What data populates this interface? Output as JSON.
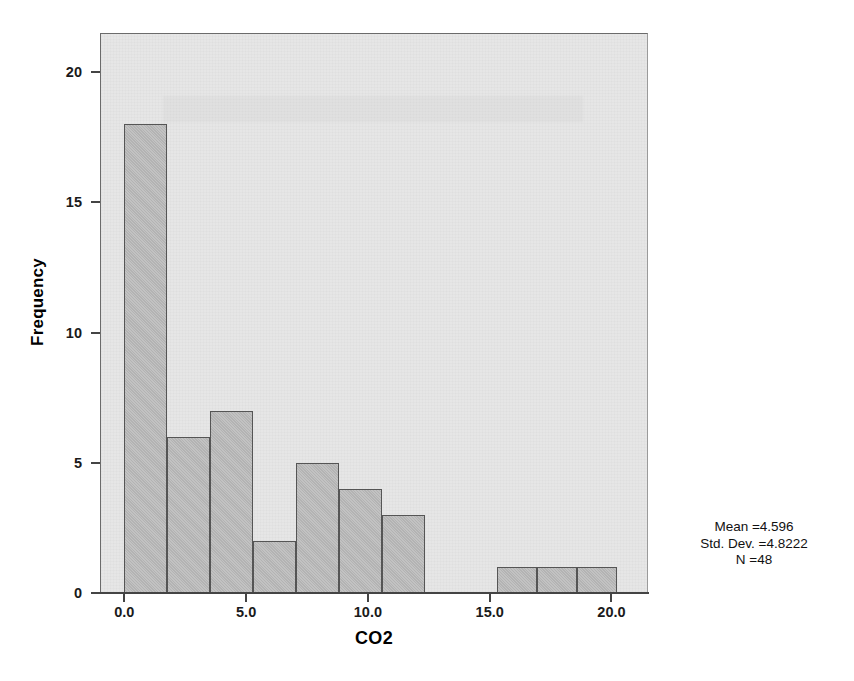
{
  "chart_data": {
    "type": "bar",
    "chart_style": "histogram",
    "title": "",
    "xlabel": "CO2",
    "ylabel": "Frequency",
    "xlim": [
      -1.0,
      21.5
    ],
    "ylim": [
      0,
      21.5
    ],
    "grid": false,
    "legend": "none",
    "bin_width": 1.7647,
    "x_ticks": [
      "0.0",
      "5.0",
      "10.0",
      "15.0",
      "20.0"
    ],
    "x_tick_values": [
      0.0,
      5.0,
      10.0,
      15.0,
      20.0
    ],
    "y_ticks": [
      "0",
      "5",
      "10",
      "15",
      "20"
    ],
    "y_tick_values": [
      0,
      5,
      10,
      15,
      20
    ],
    "bins": [
      {
        "x0": 0.0,
        "x1": 1.76,
        "value": 18
      },
      {
        "x0": 1.76,
        "x1": 3.53,
        "value": 6
      },
      {
        "x0": 3.53,
        "x1": 5.29,
        "value": 7
      },
      {
        "x0": 5.29,
        "x1": 7.06,
        "value": 2
      },
      {
        "x0": 7.06,
        "x1": 8.82,
        "value": 5
      },
      {
        "x0": 8.82,
        "x1": 10.59,
        "value": 4
      },
      {
        "x0": 10.59,
        "x1": 12.35,
        "value": 3
      },
      {
        "x0": 15.29,
        "x1": 16.94,
        "value": 1
      },
      {
        "x0": 16.94,
        "x1": 18.59,
        "value": 1
      },
      {
        "x0": 18.59,
        "x1": 20.24,
        "value": 1
      }
    ],
    "values": [
      18,
      6,
      7,
      2,
      5,
      4,
      3,
      1,
      1,
      1
    ],
    "annotations": {
      "mean_label": "Mean =4.596",
      "std_label": "Std. Dev. =4.8222",
      "n_label": "N =48"
    },
    "colors": {
      "bar_fill": "#b3b3b3",
      "bar_stroke": "#555555",
      "panel_bg": "#e6e6e6",
      "panel_border": "#6b6b6b",
      "axis": "#444444",
      "text": "#111111",
      "page_bg": "#ffffff"
    }
  },
  "statistics": {
    "mean": "Mean =4.596",
    "std_dev": "Std. Dev. =4.8222",
    "n": "N =48"
  },
  "axes": {
    "x_title": "CO2",
    "y_title": "Frequency",
    "x_tick_labels": [
      "0.0",
      "5.0",
      "10.0",
      "15.0",
      "20.0"
    ],
    "y_tick_labels": [
      "0",
      "5",
      "10",
      "15",
      "20"
    ]
  }
}
